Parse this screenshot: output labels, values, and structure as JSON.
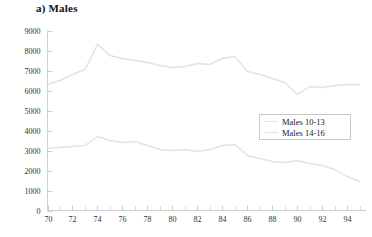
{
  "chart_data": {
    "type": "line",
    "title": "a) Males",
    "xlabel": "",
    "ylabel": "",
    "xlim": [
      70,
      95.5
    ],
    "ylim": [
      0,
      9000
    ],
    "grid": false,
    "legend_position": "center-right",
    "x_tick_labels": [
      "70",
      "72",
      "74",
      "76",
      "78",
      "80",
      "82",
      "84",
      "86",
      "88",
      "90",
      "92",
      "94"
    ],
    "x_tick_values": [
      70,
      72,
      74,
      76,
      78,
      80,
      82,
      84,
      86,
      88,
      90,
      92,
      94
    ],
    "x_minor_ticks": [
      71,
      73,
      75,
      77,
      79,
      81,
      83,
      85,
      87,
      89,
      91,
      93,
      95
    ],
    "y_tick_labels": [
      "0",
      "1000",
      "2000",
      "3000",
      "4000",
      "5000",
      "6000",
      "7000",
      "8000",
      "9000"
    ],
    "y_tick_values": [
      0,
      1000,
      2000,
      3000,
      4000,
      5000,
      6000,
      7000,
      8000,
      9000
    ],
    "x": [
      70,
      71,
      72,
      73,
      74,
      75,
      76,
      77,
      78,
      79,
      80,
      81,
      82,
      83,
      84,
      85,
      86,
      87,
      88,
      89,
      90,
      91,
      92,
      93,
      94,
      95
    ],
    "series": [
      {
        "name": "Males 14-16",
        "color": "#e2e2e2",
        "values": [
          6300,
          6500,
          6800,
          7050,
          8300,
          7750,
          7600,
          7500,
          7400,
          7250,
          7150,
          7200,
          7350,
          7300,
          7600,
          7700,
          6950,
          6800,
          6600,
          6400,
          5800,
          6200,
          6150,
          6250,
          6300,
          6300
        ]
      },
      {
        "name": "Males 10-13",
        "color": "#e4e4e4",
        "values": [
          3100,
          3150,
          3200,
          3250,
          3700,
          3500,
          3400,
          3450,
          3250,
          3050,
          3000,
          3050,
          2950,
          3050,
          3250,
          3300,
          2750,
          2600,
          2450,
          2400,
          2500,
          2350,
          2250,
          2050,
          1700,
          1450
        ]
      }
    ]
  },
  "legend": {
    "entries": [
      {
        "label": "Males 10-13"
      },
      {
        "label": "Males 14-16"
      }
    ]
  }
}
